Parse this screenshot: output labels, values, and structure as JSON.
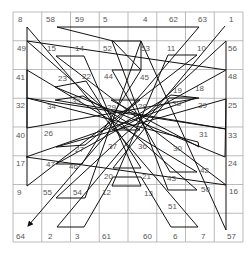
{
  "diagram": {
    "type": "magic-square-path",
    "grid": {
      "rows": 8,
      "cols": 8,
      "left": 13,
      "top": 12,
      "size": 230,
      "line_color": "#aaaaaa"
    },
    "path_color": "#111111",
    "label_color": "#555555",
    "square": [
      [
        8,
        58,
        59,
        5,
        4,
        62,
        63,
        1
      ],
      [
        49,
        15,
        14,
        52,
        53,
        11,
        10,
        56
      ],
      [
        41,
        23,
        22,
        44,
        45,
        19,
        18,
        48
      ],
      [
        32,
        34,
        35,
        29,
        28,
        38,
        39,
        25
      ],
      [
        40,
        26,
        27,
        37,
        36,
        30,
        31,
        33
      ],
      [
        17,
        47,
        46,
        20,
        21,
        43,
        42,
        24
      ],
      [
        9,
        55,
        54,
        12,
        13,
        51,
        50,
        16
      ],
      [
        64,
        2,
        3,
        61,
        60,
        6,
        7,
        57
      ]
    ],
    "labels": [
      {
        "n": "8",
        "x": 18,
        "y": 22
      },
      {
        "n": "58",
        "x": 46,
        "y": 22
      },
      {
        "n": "59",
        "x": 75,
        "y": 22
      },
      {
        "n": "5",
        "x": 103,
        "y": 22
      },
      {
        "n": "4",
        "x": 143,
        "y": 22
      },
      {
        "n": "62",
        "x": 169,
        "y": 22
      },
      {
        "n": "63",
        "x": 198,
        "y": 22
      },
      {
        "n": "1",
        "x": 229,
        "y": 22
      },
      {
        "n": "49",
        "x": 17,
        "y": 51
      },
      {
        "n": "15",
        "x": 47,
        "y": 51
      },
      {
        "n": "14",
        "x": 75,
        "y": 51
      },
      {
        "n": "52",
        "x": 103,
        "y": 51
      },
      {
        "n": "53",
        "x": 141,
        "y": 51
      },
      {
        "n": "11",
        "x": 167,
        "y": 51
      },
      {
        "n": "10",
        "x": 197,
        "y": 51
      },
      {
        "n": "56",
        "x": 228,
        "y": 51
      },
      {
        "n": "41",
        "x": 16,
        "y": 80
      },
      {
        "n": "23",
        "x": 58,
        "y": 81
      },
      {
        "n": "22",
        "x": 82,
        "y": 79
      },
      {
        "n": "44",
        "x": 104,
        "y": 79
      },
      {
        "n": "45",
        "x": 140,
        "y": 80
      },
      {
        "n": "19",
        "x": 173,
        "y": 93
      },
      {
        "n": "18",
        "x": 195,
        "y": 91
      },
      {
        "n": "48",
        "x": 228,
        "y": 79
      },
      {
        "n": "32",
        "x": 16,
        "y": 108
      },
      {
        "n": "34",
        "x": 47,
        "y": 109
      },
      {
        "n": "35",
        "x": 72,
        "y": 104
      },
      {
        "n": "29",
        "x": 107,
        "y": 110
      },
      {
        "n": "28",
        "x": 138,
        "y": 109
      },
      {
        "n": "38",
        "x": 172,
        "y": 106
      },
      {
        "n": "39",
        "x": 198,
        "y": 108
      },
      {
        "n": "25",
        "x": 228,
        "y": 108
      },
      {
        "n": "40",
        "x": 16,
        "y": 138
      },
      {
        "n": "26",
        "x": 44,
        "y": 136
      },
      {
        "n": "27",
        "x": 75,
        "y": 152
      },
      {
        "n": "37",
        "x": 108,
        "y": 149
      },
      {
        "n": "36",
        "x": 138,
        "y": 149
      },
      {
        "n": "30",
        "x": 173,
        "y": 151
      },
      {
        "n": "31",
        "x": 199,
        "y": 137
      },
      {
        "n": "33",
        "x": 228,
        "y": 138
      },
      {
        "n": "17",
        "x": 16,
        "y": 166
      },
      {
        "n": "47",
        "x": 46,
        "y": 167
      },
      {
        "n": "46",
        "x": 69,
        "y": 169
      },
      {
        "n": "20",
        "x": 104,
        "y": 179
      },
      {
        "n": "21",
        "x": 142,
        "y": 179
      },
      {
        "n": "43",
        "x": 167,
        "y": 181
      },
      {
        "n": "42",
        "x": 200,
        "y": 173
      },
      {
        "n": "24",
        "x": 228,
        "y": 166
      },
      {
        "n": "9",
        "x": 17,
        "y": 195
      },
      {
        "n": "55",
        "x": 43,
        "y": 195
      },
      {
        "n": "54",
        "x": 73,
        "y": 195
      },
      {
        "n": "12",
        "x": 102,
        "y": 195
      },
      {
        "n": "13",
        "x": 144,
        "y": 196
      },
      {
        "n": "51",
        "x": 168,
        "y": 209
      },
      {
        "n": "50",
        "x": 201,
        "y": 192
      },
      {
        "n": "16",
        "x": 229,
        "y": 194
      },
      {
        "n": "64",
        "x": 16,
        "y": 239
      },
      {
        "n": "2",
        "x": 48,
        "y": 239
      },
      {
        "n": "3",
        "x": 75,
        "y": 239
      },
      {
        "n": "61",
        "x": 102,
        "y": 239
      },
      {
        "n": "60",
        "x": 143,
        "y": 239
      },
      {
        "n": "6",
        "x": 173,
        "y": 239
      },
      {
        "n": "7",
        "x": 201,
        "y": 239
      },
      {
        "n": "57",
        "x": 227,
        "y": 239
      }
    ],
    "path_points": [
      [
        225,
        26
      ],
      [
        57,
        227
      ],
      [
        84,
        227
      ],
      [
        113,
        177
      ],
      [
        141,
        177
      ],
      [
        171,
        227
      ],
      [
        198,
        227
      ],
      [
        27,
        27
      ],
      [
        27,
        186
      ],
      [
        197,
        55
      ],
      [
        168,
        55
      ],
      [
        112,
        186
      ],
      [
        141,
        186
      ],
      [
        84,
        56
      ],
      [
        56,
        56
      ],
      [
        226,
        185
      ],
      [
        26,
        157
      ],
      [
        196,
        98
      ],
      [
        169,
        98
      ],
      [
        113,
        168
      ],
      [
        141,
        168
      ],
      [
        86,
        81
      ],
      [
        55,
        87
      ],
      [
        225,
        157
      ],
      [
        226,
        99
      ],
      [
        56,
        147
      ],
      [
        85,
        145
      ],
      [
        140,
        100
      ],
      [
        111,
        100
      ],
      [
        199,
        147
      ],
      [
        198,
        142
      ],
      [
        27,
        98
      ],
      [
        226,
        129
      ],
      [
        55,
        100
      ],
      [
        83,
        96
      ],
      [
        140,
        130
      ],
      [
        112,
        130
      ],
      [
        171,
        95
      ],
      [
        199,
        98
      ],
      [
        27,
        128
      ],
      [
        27,
        70
      ],
      [
        197,
        172
      ],
      [
        170,
        172
      ],
      [
        112,
        70
      ],
      [
        141,
        70
      ],
      [
        82,
        164
      ],
      [
        56,
        164
      ],
      [
        226,
        70
      ],
      [
        27,
        41
      ],
      [
        197,
        190
      ],
      [
        168,
        190
      ],
      [
        112,
        41
      ],
      [
        141,
        41
      ],
      [
        85,
        198
      ],
      [
        56,
        198
      ],
      [
        226,
        41
      ],
      [
        226,
        230
      ],
      [
        141,
        41
      ],
      [
        141,
        70
      ],
      [
        113,
        41
      ],
      [
        57,
        27
      ],
      [
        171,
        27
      ],
      [
        199,
        27
      ]
    ],
    "end_arrow": [
      28,
      226
    ]
  }
}
